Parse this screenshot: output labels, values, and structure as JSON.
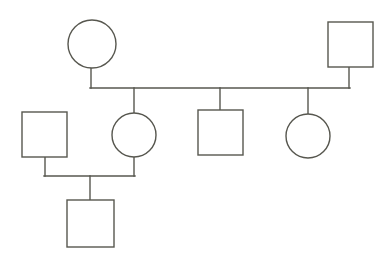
{
  "diagram": {
    "type": "pedigree",
    "background_color": "#ffffff",
    "line_color": "#57574f",
    "shape_fill": "#ffffff",
    "line_width": 1.4,
    "canvas": {
      "width": 390,
      "height": 264
    },
    "legend": {
      "circle_meaning": "female",
      "square_meaning": "male"
    },
    "generations": [
      {
        "index": 1,
        "label": "Generation I",
        "members": [
          {
            "id": "I-1",
            "shape": "circle",
            "sex": "female",
            "cx": 92,
            "cy": 44,
            "r": 24,
            "label": ""
          },
          {
            "id": "I-2",
            "shape": "square",
            "sex": "male",
            "x": 328,
            "y": 22,
            "width": 45,
            "height": 45,
            "label": ""
          }
        ]
      },
      {
        "index": 2,
        "label": "Generation II",
        "members": [
          {
            "id": "II-1",
            "shape": "square",
            "sex": "male",
            "x": 22,
            "y": 112,
            "width": 45,
            "height": 45,
            "label": ""
          },
          {
            "id": "II-2",
            "shape": "circle",
            "sex": "female",
            "cx": 134,
            "cy": 135,
            "r": 22,
            "label": ""
          },
          {
            "id": "II-3",
            "shape": "square",
            "sex": "male",
            "x": 198,
            "y": 110,
            "width": 45,
            "height": 45,
            "label": ""
          },
          {
            "id": "II-4",
            "shape": "circle",
            "sex": "female",
            "cx": 308,
            "cy": 136,
            "r": 22,
            "label": ""
          }
        ]
      },
      {
        "index": 3,
        "label": "Generation III",
        "members": [
          {
            "id": "III-1",
            "shape": "square",
            "sex": "male",
            "x": 67,
            "y": 200,
            "width": 47,
            "height": 47,
            "label": ""
          }
        ]
      }
    ],
    "unions": [
      {
        "id": "union-1",
        "partners": [
          "I-1",
          "I-2"
        ],
        "sibship_line_y": 88,
        "sibship_line_x1": 91,
        "sibship_line_x2": 349,
        "children": [
          "II-2",
          "II-3",
          "II-4"
        ],
        "child_drop_x": [
          134,
          220,
          308
        ]
      },
      {
        "id": "union-2",
        "partners": [
          "II-1",
          "II-2"
        ],
        "sibship_line_y": 176,
        "sibship_line_x1": 45,
        "sibship_line_x2": 134,
        "children": [
          "III-1"
        ],
        "child_drop_x": [
          90
        ]
      }
    ],
    "connectors": [
      {
        "id": "drop-I-1",
        "from": "I-1",
        "x": 91,
        "y1": 68,
        "y2": 88
      },
      {
        "id": "drop-I-2",
        "from": "I-2",
        "x": 349,
        "y1": 67,
        "y2": 88
      },
      {
        "id": "drop-II-2-child",
        "from": "II-2",
        "x": 134,
        "y1": 157,
        "y2": 176
      },
      {
        "id": "drop-II-1-child",
        "from": "II-1",
        "x": 45,
        "y1": 157,
        "y2": 176
      },
      {
        "id": "drop-III-1",
        "from": "III-1",
        "x": 90,
        "y1": 176,
        "y2": 200
      },
      {
        "id": "drop-to-II-2",
        "x": 134,
        "y1": 88,
        "y2": 113
      },
      {
        "id": "drop-to-II-3",
        "x": 220,
        "y1": 88,
        "y2": 110
      },
      {
        "id": "drop-to-II-4",
        "x": 308,
        "y1": 88,
        "y2": 114
      }
    ]
  }
}
